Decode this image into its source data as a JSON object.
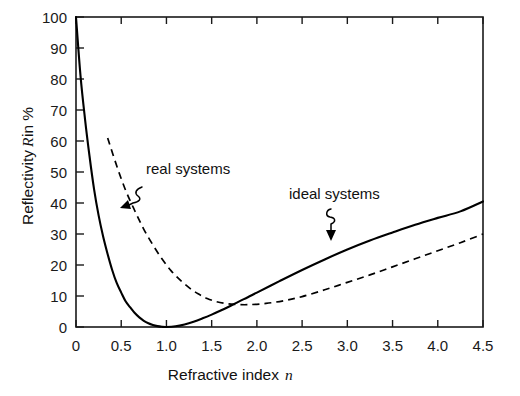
{
  "chart_data": {
    "type": "line",
    "title": "",
    "xlabel": "Refractive index n",
    "xlabel_plain": "Refractive index",
    "xlabel_italic": "n",
    "ylabel": "Reflectivity R in %",
    "ylabel_part1": "Reflectivity",
    "ylabel_italic": "R",
    "ylabel_part2": "in %",
    "xlim": [
      0,
      4.5
    ],
    "ylim": [
      0,
      100
    ],
    "grid": false,
    "legend_position": "inline-annotations",
    "xticks": [
      0,
      0.5,
      1.0,
      1.5,
      2.0,
      2.5,
      3.0,
      3.5,
      4.0,
      4.5
    ],
    "xtick_labels": [
      "0",
      "0.5",
      "1.0",
      "1.5",
      "2.0",
      "2.5",
      "3.0",
      "3.5",
      "4.0",
      "4.5"
    ],
    "yticks": [
      0,
      10,
      20,
      30,
      40,
      50,
      60,
      70,
      80,
      90,
      100
    ],
    "ytick_labels": [
      "0",
      "10",
      "20",
      "30",
      "40",
      "50",
      "60",
      "70",
      "80",
      "90",
      "100"
    ],
    "annotations": [
      {
        "text": "real systems",
        "x": 1.05,
        "y": 50,
        "points_to_series": "real systems"
      },
      {
        "text": "ideal systems",
        "x": 2.55,
        "y": 41,
        "points_to_series": "ideal systems"
      }
    ],
    "series": [
      {
        "name": "ideal systems",
        "style": "solid",
        "color": "#000000",
        "x": [
          0.0,
          0.05,
          0.1,
          0.15,
          0.2,
          0.25,
          0.3,
          0.35,
          0.4,
          0.45,
          0.5,
          0.55,
          0.6,
          0.65,
          0.7,
          0.75,
          0.8,
          0.85,
          0.9,
          0.95,
          1.0,
          1.1,
          1.2,
          1.3,
          1.4,
          1.5,
          1.6,
          1.7,
          1.8,
          1.9,
          2.0,
          2.25,
          2.5,
          2.75,
          3.0,
          3.25,
          3.5,
          3.75,
          4.0,
          4.25,
          4.5
        ],
        "values": [
          100,
          81,
          67,
          55,
          44.4,
          36,
          29.2,
          23.5,
          18.4,
          14.2,
          11.1,
          8.2,
          6.3,
          4.5,
          3.1,
          2.0,
          1.2,
          0.65,
          0.28,
          0.07,
          0.0,
          0.23,
          0.83,
          1.7,
          2.8,
          4.0,
          5.3,
          6.7,
          8.2,
          9.6,
          11.1,
          14.8,
          18.4,
          21.8,
          25.0,
          27.9,
          30.5,
          33.0,
          35.2,
          37.3,
          40.5
        ]
      },
      {
        "name": "real systems",
        "style": "dashed",
        "color": "#000000",
        "x": [
          0.35,
          0.45,
          0.55,
          0.65,
          0.75,
          0.85,
          0.95,
          1.05,
          1.15,
          1.25,
          1.35,
          1.45,
          1.55,
          1.65,
          1.75,
          1.9,
          2.1,
          2.3,
          2.5,
          2.75,
          3.0,
          3.25,
          3.5,
          3.75,
          4.0,
          4.25,
          4.5
        ],
        "values": [
          61,
          52,
          44,
          37.5,
          31.5,
          26.5,
          22.0,
          18.2,
          15.2,
          12.7,
          10.7,
          9.2,
          8.2,
          7.6,
          7.3,
          7.2,
          7.6,
          8.5,
          9.8,
          12.0,
          14.4,
          16.8,
          19.4,
          22.0,
          24.6,
          27.2,
          30.0
        ]
      }
    ]
  },
  "axes_geometry": {
    "left_px": 76,
    "right_px": 483,
    "top_px": 17,
    "bottom_px": 327
  }
}
